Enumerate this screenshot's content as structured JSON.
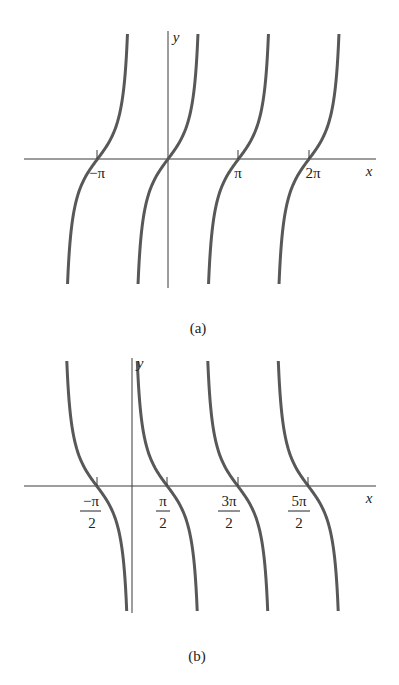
{
  "chart_data": [
    {
      "type": "line",
      "panel": "a",
      "caption": "(a)",
      "function": "y = tan x",
      "xlabel": "x",
      "ylabel": "y",
      "tick_labels": [
        "−π",
        "π",
        "2π"
      ],
      "tick_values": [
        -3.14159,
        3.14159,
        6.28318
      ],
      "zeros": [
        -3.14159,
        0,
        3.14159,
        6.28318
      ],
      "asymptotes": [
        -4.71239,
        -1.5708,
        1.5708,
        4.71239,
        7.85398
      ],
      "xlim": [
        -5.0,
        9.3
      ],
      "grid": false,
      "legend": null,
      "color": "#585858"
    },
    {
      "type": "line",
      "panel": "b",
      "caption": "(b)",
      "function": "y = cot x",
      "xlabel": "x",
      "ylabel": "y",
      "tick_labels": [
        {
          "num": "−π",
          "den": "2"
        },
        {
          "num": "π",
          "den": "2"
        },
        {
          "num": "3π",
          "den": "2"
        },
        {
          "num": "5π",
          "den": "2"
        }
      ],
      "tick_values": [
        -1.5708,
        1.5708,
        4.71239,
        7.85398
      ],
      "zeros": [
        -1.5708,
        1.5708,
        4.71239,
        7.85398
      ],
      "asymptotes": [
        -3.14159,
        0,
        3.14159,
        6.28318,
        9.42478
      ],
      "xlim": [
        -4.8,
        10.5
      ],
      "grid": false,
      "legend": null,
      "color": "#585858"
    }
  ],
  "panels": {
    "a": {
      "caption": "(a)",
      "x_axis_label": "x",
      "y_axis_label": "y",
      "ticks": [
        {
          "label": "−π"
        },
        {
          "label": "π"
        },
        {
          "label": "2π"
        }
      ]
    },
    "b": {
      "caption": "(b)",
      "x_axis_label": "x",
      "y_axis_label": "y",
      "ticks": [
        {
          "num": "−π",
          "den": "2"
        },
        {
          "num": "π",
          "den": "2"
        },
        {
          "num": "3π",
          "den": "2"
        },
        {
          "num": "5π",
          "den": "2"
        }
      ]
    }
  }
}
